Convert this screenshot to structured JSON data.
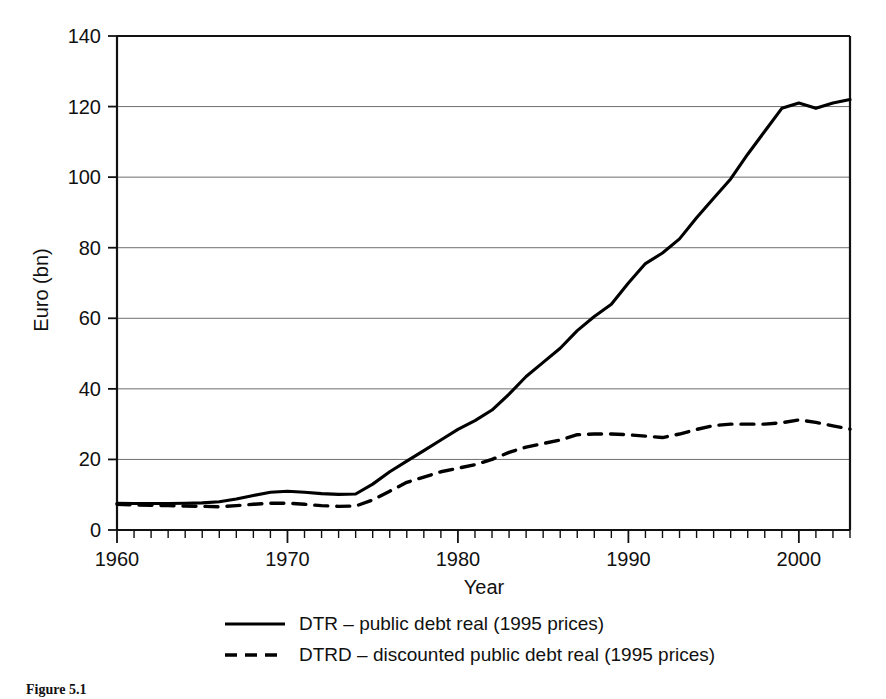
{
  "figure": {
    "caption": "Figure 5.1",
    "background": "#ffffff",
    "ink_color": "#000000",
    "grid_color": "#6f6f6f"
  },
  "chart_data": {
    "type": "line",
    "title": "",
    "xlabel": "Year",
    "ylabel": "Euro (bn)",
    "xlim": [
      1960,
      2003
    ],
    "ylim": [
      0,
      140
    ],
    "xticks": [
      1960,
      1970,
      1980,
      1990,
      2000
    ],
    "xtick_labels": [
      "1960",
      "1970",
      "1980",
      "1990",
      "2000"
    ],
    "x_minor_tick_step": 1,
    "yticks": [
      0,
      20,
      40,
      60,
      80,
      100,
      120,
      140
    ],
    "ytick_labels": [
      "0",
      "20",
      "40",
      "60",
      "80",
      "100",
      "120",
      "140"
    ],
    "grid": "horizontal",
    "legend_position": "below",
    "x": [
      1960,
      1961,
      1962,
      1963,
      1964,
      1965,
      1966,
      1967,
      1968,
      1969,
      1970,
      1971,
      1972,
      1973,
      1974,
      1975,
      1976,
      1977,
      1978,
      1979,
      1980,
      1981,
      1982,
      1983,
      1984,
      1985,
      1986,
      1987,
      1988,
      1989,
      1990,
      1991,
      1992,
      1993,
      1994,
      1995,
      1996,
      1997,
      1998,
      1999,
      2000,
      2001,
      2002,
      2003
    ],
    "series": [
      {
        "name": "DTR – public debt real (1995 prices)",
        "key": "DTR",
        "style": "solid",
        "color": "#000000",
        "values": [
          7.6,
          7.5,
          7.5,
          7.5,
          7.6,
          7.7,
          8.0,
          8.8,
          9.8,
          10.7,
          11.0,
          10.7,
          10.3,
          10.1,
          10.2,
          13.0,
          16.5,
          19.5,
          22.5,
          25.5,
          28.5,
          31.0,
          34.0,
          38.5,
          43.5,
          47.5,
          51.5,
          56.5,
          60.5,
          64.0,
          70.0,
          75.5,
          78.5,
          82.5,
          88.5,
          94.0,
          99.5,
          106.5,
          113.0,
          119.5,
          121.0,
          119.5,
          121.0,
          122.0
        ]
      },
      {
        "name": "DTRD – discounted public debt real (1995 prices)",
        "key": "DTRD",
        "style": "dashed",
        "color": "#000000",
        "values": [
          7.3,
          7.1,
          7.0,
          6.9,
          6.8,
          6.7,
          6.6,
          6.9,
          7.3,
          7.6,
          7.6,
          7.3,
          6.9,
          6.7,
          6.8,
          8.5,
          11.0,
          13.5,
          15.0,
          16.5,
          17.5,
          18.5,
          20.0,
          22.0,
          23.5,
          24.5,
          25.5,
          27.0,
          27.2,
          27.2,
          27.0,
          26.6,
          26.2,
          27.2,
          28.5,
          29.6,
          30.0,
          30.0,
          30.0,
          30.4,
          31.2,
          30.5,
          29.5,
          28.6
        ]
      }
    ]
  },
  "legend": {
    "entries": [
      {
        "label": "DTR – public debt real (1995 prices)",
        "style": "solid"
      },
      {
        "label": "DTRD – discounted public debt real (1995 prices)",
        "style": "dashed"
      }
    ]
  }
}
